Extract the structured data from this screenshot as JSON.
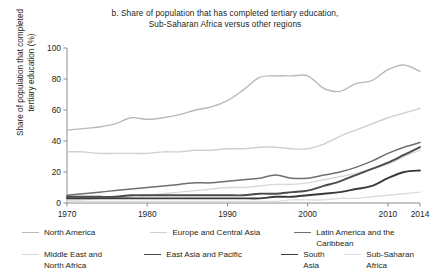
{
  "figure": {
    "title_line1": "b. Share of population that has completed tertiary education,",
    "title_line2": "Sub-Saharan Africa versus other regions",
    "y_axis_title_line1": "Share of population that completed",
    "y_axis_title_line2": "tertiary education (%)"
  },
  "axis": {
    "y_ticks": [
      "0",
      "20",
      "40",
      "60",
      "80",
      "100"
    ],
    "x_ticks": [
      "1970",
      "1980",
      "1990",
      "2000",
      "2010",
      "2014"
    ]
  },
  "legend": {
    "row1": [
      {
        "label": "North America",
        "color": "#b9b9b9",
        "width": 1.3
      },
      {
        "label": "Europe and Central Asia",
        "color": "#cfcfcf",
        "width": 1.3
      },
      {
        "label": "Latin America and the Caribbean",
        "color": "#6f6f6f",
        "width": 1.5
      }
    ],
    "row2": [
      {
        "label": "Middle East and",
        "label2": "North Africa",
        "color": "#d8d8d8",
        "width": 1.3
      },
      {
        "label": "East Asia and Pacific",
        "label2": "",
        "color": "#4a4a4a",
        "width": 1.8
      },
      {
        "label": "South Asia",
        "label2": "",
        "color": "#3a3a3a",
        "width": 1.8
      },
      {
        "label": "Sub-Saharan Africa",
        "label2": "",
        "color": "#dddddd",
        "width": 1.3
      }
    ]
  },
  "chart_data": {
    "type": "line",
    "title": "b. Share of population that has completed tertiary education, Sub-Saharan Africa versus other regions",
    "xlabel": "",
    "ylabel": "Share of population that completed tertiary education (%)",
    "xlim": [
      1970,
      2014
    ],
    "ylim": [
      0,
      100
    ],
    "ytick_step": 20,
    "grid": false,
    "legend_position": "bottom",
    "x": [
      1970,
      1972,
      1974,
      1976,
      1978,
      1980,
      1982,
      1984,
      1986,
      1988,
      1990,
      1992,
      1994,
      1996,
      1998,
      2000,
      2002,
      2004,
      2006,
      2008,
      2010,
      2012,
      2014
    ],
    "series": [
      {
        "name": "North America",
        "color": "#b9b9b9",
        "values": [
          47,
          48,
          49,
          51,
          55,
          54,
          55,
          57,
          60,
          62,
          66,
          73,
          81,
          82,
          82,
          82,
          74,
          72,
          77,
          79,
          86,
          89,
          85
        ]
      },
      {
        "name": "Europe and Central Asia",
        "color": "#cfcfcf",
        "values": [
          33,
          33,
          32,
          32,
          32,
          32,
          33,
          33,
          34,
          34,
          35,
          35,
          36,
          36,
          35,
          35,
          38,
          43,
          47,
          51,
          55,
          58,
          61
        ]
      },
      {
        "name": "Latin America and the Caribbean",
        "color": "#6f6f6f",
        "values": [
          5,
          6,
          7,
          8,
          9,
          10,
          11,
          12,
          13,
          13,
          14,
          15,
          16,
          18,
          16,
          16,
          18,
          20,
          23,
          27,
          32,
          36,
          39
        ]
      },
      {
        "name": "Middle East and North Africa",
        "color": "#d8d8d8",
        "values": [
          2,
          2,
          3,
          3,
          4,
          5,
          6,
          7,
          8,
          9,
          10,
          10,
          11,
          12,
          12,
          13,
          15,
          17,
          19,
          22,
          25,
          30,
          34
        ]
      },
      {
        "name": "East Asia and Pacific",
        "color": "#4a4a4a",
        "values": [
          4,
          4,
          4,
          4,
          5,
          5,
          5,
          5,
          5,
          5,
          5,
          5,
          6,
          6,
          7,
          8,
          11,
          14,
          18,
          22,
          26,
          31,
          36
        ]
      },
      {
        "name": "South Asia",
        "color": "#3a3a3a",
        "values": [
          3,
          3,
          3,
          3,
          3,
          3,
          3,
          3,
          3,
          3,
          3,
          3,
          3,
          4,
          4,
          5,
          6,
          7,
          9,
          11,
          16,
          20,
          21
        ]
      },
      {
        "name": "Sub-Saharan Africa",
        "color": "#dddddd",
        "values": [
          1,
          1,
          1,
          1,
          1,
          1,
          1,
          1,
          1,
          1,
          1,
          1,
          1,
          1,
          2,
          2,
          2,
          3,
          3,
          4,
          5,
          6,
          7
        ]
      }
    ]
  }
}
